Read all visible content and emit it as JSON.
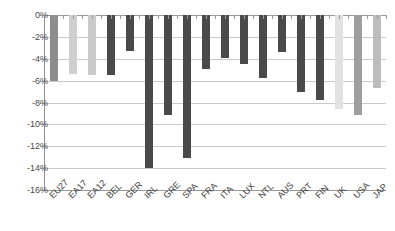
{
  "chart_data": {
    "type": "bar",
    "title": "",
    "subtitle": "",
    "xlabel": "",
    "ylabel": "",
    "ylim": [
      -16,
      0
    ],
    "ytick_labels": [
      "0%",
      "-2%",
      "-4%",
      "-6%",
      "-8%",
      "-10%",
      "-12%",
      "-14%",
      "-16%"
    ],
    "ytick_values": [
      0,
      -2,
      -4,
      -6,
      -8,
      -10,
      -12,
      -14,
      -16
    ],
    "grid": true,
    "legend": "none",
    "value_unit": "%",
    "categories": [
      "EU27",
      "EA17",
      "EA12",
      "BEL",
      "GER",
      "IRL",
      "GRE",
      "SPA",
      "FRA",
      "ITA",
      "LUX",
      "NTL",
      "AUS",
      "PRT",
      "FIN",
      "UK",
      "USA",
      "JAP"
    ],
    "values": [
      -6.0,
      -5.4,
      -5.5,
      -5.5,
      -3.3,
      -14.0,
      -9.1,
      -13.1,
      -4.9,
      -3.9,
      -4.5,
      -5.8,
      -3.4,
      -7.0,
      -7.8,
      -8.6,
      -9.1,
      -6.7
    ],
    "bar_colors": [
      "#8d8d8d",
      "#cfcfcf",
      "#cacaca",
      "#4a4a4a",
      "#4a4a4a",
      "#4a4a4a",
      "#4a4a4a",
      "#4a4a4a",
      "#4a4a4a",
      "#4a4a4a",
      "#4a4a4a",
      "#4a4a4a",
      "#4a4a4a",
      "#4a4a4a",
      "#4a4a4a",
      "#e2e2e2",
      "#9e9e9e",
      "#bdbdbd"
    ]
  },
  "colors": {
    "background": "#ffffff",
    "gridline": "#c9c9c9",
    "axis": "#8f8f8f",
    "text": "#3a3a3a",
    "bar_dark": "#4a4a4a",
    "bar_medium": "#8d8d8d",
    "bar_light": "#cfcfcf"
  }
}
